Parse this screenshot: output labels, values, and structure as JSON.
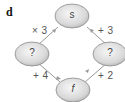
{
  "part_label": "d",
  "nodes": {
    "top": {
      "label": "s"
    },
    "left": {
      "label": "?"
    },
    "right": {
      "label": "?"
    },
    "bottom": {
      "label": "f"
    }
  },
  "edges": {
    "left_top": {
      "from": "left",
      "to": "top",
      "op": "× 3"
    },
    "right_top": {
      "from": "right",
      "to": "top",
      "op": "+ 3"
    },
    "left_bottom": {
      "from": "left",
      "to": "bottom",
      "op": "+ 4"
    },
    "bottom_right": {
      "from": "bottom",
      "to": "right",
      "op": "+ 2"
    }
  },
  "colors": {
    "node_fill_light": "#f4f4f4",
    "node_fill_dark": "#bdbdbd",
    "node_stroke": "#8a8a8a",
    "edge": "#9a9a9a"
  }
}
